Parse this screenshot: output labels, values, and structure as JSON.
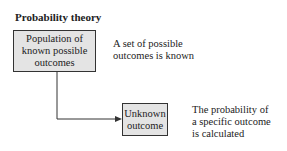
{
  "title": "Probability theory",
  "nodes": [
    {
      "id": "population",
      "label": "Population of known possible outcomes",
      "lines": [
        "Population of",
        "known possible",
        "outcomes"
      ]
    },
    {
      "id": "unknown",
      "label": "Unknown outcome",
      "lines": [
        "Unknown",
        "outcome"
      ]
    }
  ],
  "descriptions": [
    {
      "lines": [
        "A set of possible",
        "outcomes is known"
      ]
    },
    {
      "lines": [
        "The probability of",
        "a specific outcome",
        "is calculated"
      ]
    }
  ],
  "colors": {
    "box_fill": "#e4e4e4",
    "box_border": "#333333",
    "arrow": "#333333"
  }
}
